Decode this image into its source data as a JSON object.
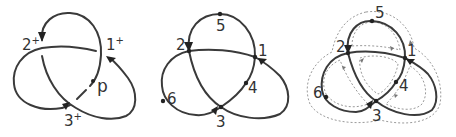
{
  "figure": {
    "panels": [
      {
        "id": "panel-a",
        "labels": {
          "c1": "1",
          "c1_sup": "+",
          "c2": "2",
          "c2_sup": "+",
          "c3": "3",
          "c3_sup": "+",
          "point": "p"
        }
      },
      {
        "id": "panel-b",
        "labels": {
          "n1": "1",
          "n2": "2",
          "n3": "3",
          "n4": "4",
          "n5": "5",
          "n6": "6"
        }
      },
      {
        "id": "panel-c",
        "labels": {
          "n1": "1",
          "n2": "2",
          "n3": "3",
          "n4": "4",
          "n5": "5",
          "n6": "6"
        }
      }
    ],
    "colors": {
      "strand": "#3a3a3a",
      "dashed": "#9a9a9a",
      "background": "#ffffff"
    }
  }
}
